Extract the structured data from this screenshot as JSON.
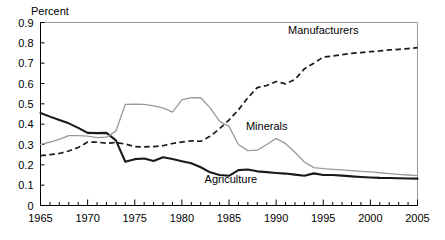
{
  "chart_data": {
    "type": "line",
    "title": "",
    "subtitle": "",
    "ylabel": "Percent",
    "xlabel": "",
    "xlim": [
      1965,
      2005
    ],
    "ylim": [
      0,
      0.9
    ],
    "grid": false,
    "legend_position": "inline-annotations",
    "y_ticks": [
      "0.9",
      "0.8",
      "0.7",
      "0.6",
      "0.5",
      "0.4",
      "0.3",
      "0.2",
      "0.1",
      "0"
    ],
    "y_tick_values": [
      0.9,
      0.8,
      0.7,
      0.6,
      0.5,
      0.4,
      0.3,
      0.2,
      0.1,
      0
    ],
    "x_ticks": [
      "1965",
      "1970",
      "1975",
      "1980",
      "1985",
      "1990",
      "1995",
      "2000",
      "2005"
    ],
    "x_tick_values": [
      1965,
      1970,
      1975,
      1980,
      1985,
      1990,
      1995,
      2000,
      2005
    ],
    "x_minor_tick_interval": 1,
    "x": [
      1965,
      1966,
      1967,
      1968,
      1969,
      1970,
      1971,
      1972,
      1973,
      1974,
      1975,
      1976,
      1977,
      1978,
      1979,
      1980,
      1981,
      1982,
      1983,
      1984,
      1985,
      1986,
      1987,
      1988,
      1989,
      1990,
      1991,
      1992,
      1993,
      1994,
      1995,
      1996,
      1997,
      1998,
      1999,
      2000,
      2001,
      2002,
      2003,
      2004,
      2005
    ],
    "series": [
      {
        "name": "Agriculture",
        "style": "solid",
        "color": "#1a1a1a",
        "label_x": 1985.2,
        "label_y": 0.112,
        "values": [
          0.455,
          0.437,
          0.42,
          0.404,
          0.382,
          0.357,
          0.356,
          0.357,
          0.32,
          0.215,
          0.228,
          0.231,
          0.219,
          0.237,
          0.229,
          0.218,
          0.208,
          0.188,
          0.163,
          0.15,
          0.146,
          0.174,
          0.177,
          0.168,
          0.164,
          0.16,
          0.157,
          0.152,
          0.146,
          0.158,
          0.15,
          0.15,
          0.147,
          0.143,
          0.14,
          0.138,
          0.136,
          0.135,
          0.134,
          0.133,
          0.132
        ]
      },
      {
        "name": "Minerals",
        "style": "solid",
        "color": "#9a9a9a",
        "label_x": 1989.0,
        "label_y": 0.373,
        "values": [
          0.3,
          0.312,
          0.325,
          0.344,
          0.344,
          0.341,
          0.334,
          0.336,
          0.366,
          0.497,
          0.499,
          0.497,
          0.49,
          0.48,
          0.459,
          0.52,
          0.53,
          0.53,
          0.48,
          0.414,
          0.389,
          0.3,
          0.27,
          0.272,
          0.3,
          0.33,
          0.304,
          0.262,
          0.214,
          0.186,
          0.181,
          0.178,
          0.175,
          0.172,
          0.168,
          0.165,
          0.161,
          0.157,
          0.153,
          0.15,
          0.147
        ]
      },
      {
        "name": "Manufacturers",
        "style": "dashed",
        "color": "#1a1a1a",
        "label_x": 1995.0,
        "label_y": 0.845,
        "values": [
          0.245,
          0.25,
          0.256,
          0.268,
          0.285,
          0.312,
          0.312,
          0.306,
          0.31,
          0.302,
          0.29,
          0.288,
          0.29,
          0.294,
          0.305,
          0.312,
          0.318,
          0.316,
          0.34,
          0.378,
          0.42,
          0.47,
          0.53,
          0.58,
          0.59,
          0.61,
          0.598,
          0.62,
          0.672,
          0.7,
          0.73,
          0.735,
          0.742,
          0.748,
          0.752,
          0.757,
          0.76,
          0.765,
          0.768,
          0.772,
          0.776
        ]
      }
    ]
  }
}
